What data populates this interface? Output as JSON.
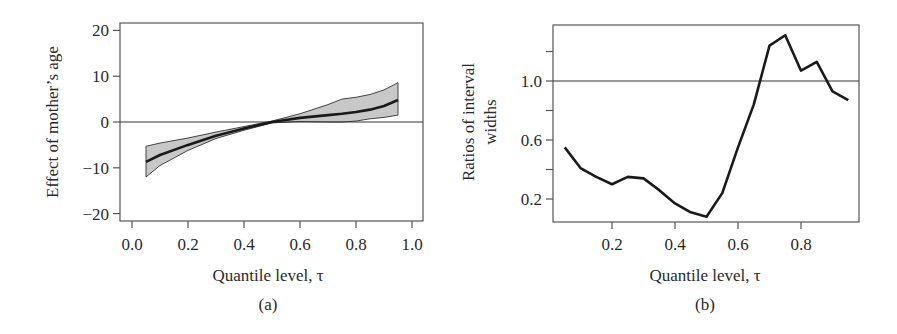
{
  "chart_data": [
    {
      "type": "line",
      "panel": "(a)",
      "title": "",
      "xlabel": "Quantile level, τ",
      "ylabel": "Effect of mother’s age",
      "xlim": [
        -0.04,
        1.04
      ],
      "ylim": [
        -21,
        22
      ],
      "xticks": [
        0.0,
        0.2,
        0.4,
        0.6,
        0.8,
        1.0
      ],
      "xtick_labels": [
        "0.0",
        "0.2",
        "0.4",
        "0.6",
        "0.8",
        "1.0"
      ],
      "yticks": [
        20,
        10,
        0,
        -10,
        -20
      ],
      "ytick_labels": [
        "20",
        "10",
        "0",
        "−10",
        "−20"
      ],
      "grid": false,
      "reference_line": 0,
      "x": [
        0.05,
        0.1,
        0.2,
        0.3,
        0.4,
        0.5,
        0.6,
        0.7,
        0.75,
        0.8,
        0.85,
        0.9,
        0.95
      ],
      "series": [
        {
          "name": "estimate",
          "values": [
            -8.7,
            -7.2,
            -5.0,
            -3.0,
            -1.4,
            0.0,
            0.9,
            1.5,
            1.8,
            2.2,
            2.7,
            3.5,
            4.8
          ]
        },
        {
          "name": "upper band",
          "values": [
            -5.3,
            -4.6,
            -3.5,
            -2.2,
            -1.0,
            0.2,
            1.8,
            3.8,
            5.0,
            5.4,
            6.0,
            7.0,
            8.6
          ]
        },
        {
          "name": "lower band",
          "values": [
            -12.0,
            -9.5,
            -6.2,
            -3.6,
            -1.8,
            -0.2,
            0.1,
            0.0,
            0.0,
            0.2,
            0.7,
            1.0,
            1.5
          ]
        }
      ],
      "band_color": "#c8c8c8",
      "line_color": "#1a1a1a"
    },
    {
      "type": "line",
      "panel": "(b)",
      "title": "",
      "xlabel": "Quantile level, τ",
      "ylabel": "Ratios of interval widths",
      "ylabel_lines": [
        "Ratios of interval",
        "widths"
      ],
      "xlim": [
        0.0,
        1.0
      ],
      "ylim": [
        0.15,
        1.49
      ],
      "xticks": [
        0.2,
        0.4,
        0.6,
        0.8
      ],
      "xtick_labels": [
        "0.2",
        "0.4",
        "0.6",
        "0.8"
      ],
      "yticks": [
        1.2,
        1.0,
        0.8,
        0.6,
        0.4,
        0.2
      ],
      "ytick_labels": [
        "",
        "1.0",
        "",
        "0.6",
        "",
        "0.2"
      ],
      "grid": false,
      "reference_line": 1.0,
      "x": [
        0.05,
        0.1,
        0.15,
        0.2,
        0.25,
        0.3,
        0.35,
        0.4,
        0.45,
        0.5,
        0.55,
        0.6,
        0.65,
        0.7,
        0.75,
        0.8,
        0.85,
        0.9,
        0.95
      ],
      "series": [
        {
          "name": "ratio",
          "values": [
            0.55,
            0.41,
            0.35,
            0.3,
            0.35,
            0.34,
            0.26,
            0.17,
            0.11,
            0.08,
            0.24,
            0.55,
            0.84,
            1.24,
            1.31,
            1.07,
            1.13,
            0.93,
            0.87
          ]
        }
      ],
      "line_color": "#1a1a1a"
    }
  ],
  "panels": {
    "a": {
      "label": "(a)",
      "xlabel": "Quantile level, τ",
      "ylabel": "Effect of mother’s age",
      "xtick_labels": [
        "0.0",
        "0.2",
        "0.4",
        "0.6",
        "0.8",
        "1.0"
      ],
      "ytick_labels": [
        "20",
        "10",
        "0",
        "−10",
        "−20"
      ]
    },
    "b": {
      "label": "(b)",
      "xlabel": "Quantile level, τ",
      "ylabel_line1": "Ratios of interval",
      "ylabel_line2": "widths",
      "xtick_labels": [
        "0.2",
        "0.4",
        "0.6",
        "0.8"
      ],
      "ytick_labels": [
        "1.0",
        "0.6",
        "0.2"
      ]
    }
  }
}
